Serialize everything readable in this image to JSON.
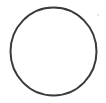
{
  "canvas": {
    "width": 106,
    "height": 103,
    "background_color": "#ffffff",
    "title": "Circle outline"
  },
  "figure": {
    "type": "circle-outline",
    "shape_name": "circle",
    "stroke_color": "#3c3a38",
    "stroke_width": 2,
    "fill": "none",
    "center_x": 53.5,
    "center_y": 51.5,
    "radius_x": 43,
    "radius_y": 44
  },
  "artifacts": [
    {
      "name": "speck",
      "x": 97,
      "y": 14,
      "size": 2,
      "color": "#e4e2e0"
    }
  ]
}
